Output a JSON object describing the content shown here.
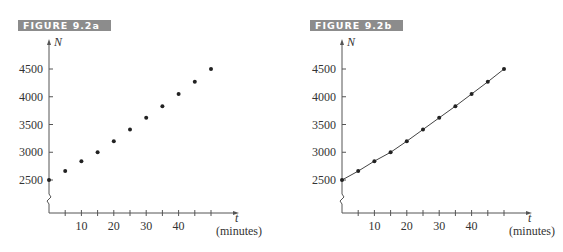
{
  "figures": [
    {
      "id": "a",
      "banner": "FIGURE 9.2a",
      "y_axis_label": "N",
      "x_axis_label": "t",
      "x_axis_unit": "(minutes)",
      "y_ticks": [
        "4500",
        "4000",
        "3500",
        "3000",
        "2500"
      ],
      "x_ticks": [
        "10",
        "20",
        "30",
        "40"
      ]
    },
    {
      "id": "b",
      "banner": "FIGURE 9.2b",
      "y_axis_label": "N",
      "x_axis_label": "t",
      "x_axis_unit": "(minutes)",
      "y_ticks": [
        "4500",
        "4000",
        "3500",
        "3000",
        "2500"
      ],
      "x_ticks": [
        "10",
        "20",
        "30",
        "40"
      ]
    }
  ],
  "chart_data": [
    {
      "type": "scatter",
      "title": "FIGURE 9.2a",
      "xlabel": "t (minutes)",
      "ylabel": "N",
      "x": [
        0,
        5,
        10,
        15,
        20,
        25,
        30,
        35,
        40,
        45,
        50
      ],
      "series": [
        {
          "name": "N",
          "values": [
            2500,
            2660,
            2840,
            3000,
            3200,
            3410,
            3620,
            3830,
            4050,
            4270,
            4500
          ]
        }
      ],
      "xlim": [
        0,
        55
      ],
      "ylim": [
        2000,
        4800
      ],
      "x_ticks": [
        10,
        20,
        30,
        40
      ],
      "x_minor_ticks_every": 5,
      "y_ticks": [
        2500,
        3000,
        3500,
        4000,
        4500
      ],
      "y_axis_break": true,
      "grid": false,
      "legend": "none"
    },
    {
      "type": "line",
      "title": "FIGURE 9.2b",
      "xlabel": "t (minutes)",
      "ylabel": "N",
      "x": [
        0,
        5,
        10,
        15,
        20,
        25,
        30,
        35,
        40,
        45,
        50
      ],
      "series": [
        {
          "name": "N",
          "values": [
            2500,
            2660,
            2840,
            3000,
            3200,
            3410,
            3620,
            3830,
            4050,
            4270,
            4500
          ],
          "markers": true
        }
      ],
      "xlim": [
        0,
        55
      ],
      "ylim": [
        2000,
        4800
      ],
      "x_ticks": [
        10,
        20,
        30,
        40
      ],
      "x_minor_ticks_every": 5,
      "y_ticks": [
        2500,
        3000,
        3500,
        4000,
        4500
      ],
      "y_axis_break": true,
      "grid": false,
      "legend": "none"
    }
  ]
}
